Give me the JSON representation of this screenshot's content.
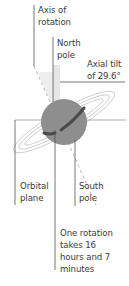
{
  "diagram": {
    "labels": {
      "axis_of_rotation": "Axis of\nrotation",
      "north_pole": "North\npole",
      "axial_tilt": "Axial tilt\nof 29.6°",
      "orbital_plane": "Orbital\nplane",
      "south_pole": "South\npole",
      "rotation_period": "One rotation\ntakes 16\nhours and 7\nminutes"
    },
    "values": {
      "axial_tilt_degrees": "29.6°",
      "rotation_hours": "16",
      "rotation_minutes": "7"
    },
    "colors": {
      "planet": "#8e8e8e",
      "band": "#4a4a4a",
      "ring": "#b0b0b0",
      "leader_line": "#555555",
      "tilt_wedge": "#e4e4e4",
      "text": "#3a3a3a"
    }
  }
}
